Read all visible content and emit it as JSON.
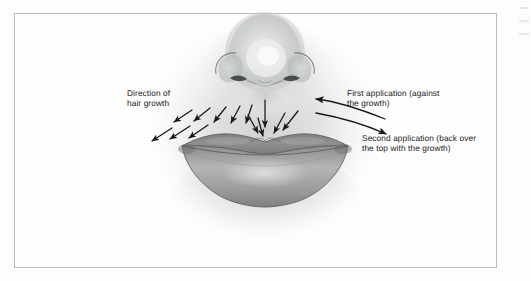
{
  "figure": {
    "type": "anatomical-illustration",
    "style": "grayscale pencil shading",
    "border_color": "#b9bcbe",
    "background_color": "#fefefe"
  },
  "annotations": {
    "direction_of_hair_growth": "Direction of\nhair growth",
    "first_application": "First application (against\nthe growth)",
    "second_application": "Second application (back over\nthe top with the growth)"
  },
  "arrows": {
    "hair_growth_color": "#171717",
    "application_color": "#171717",
    "hair_growth_count": 13,
    "application_count": 2,
    "first_application_direction": "left",
    "second_application_direction": "right"
  },
  "colors": {
    "lip_upper": "#8d8f90",
    "lip_lower": "#a0a2a3",
    "lip_outline": "#5d5f60",
    "skin_shadow": "#cfd1d2",
    "text": "#232323"
  }
}
